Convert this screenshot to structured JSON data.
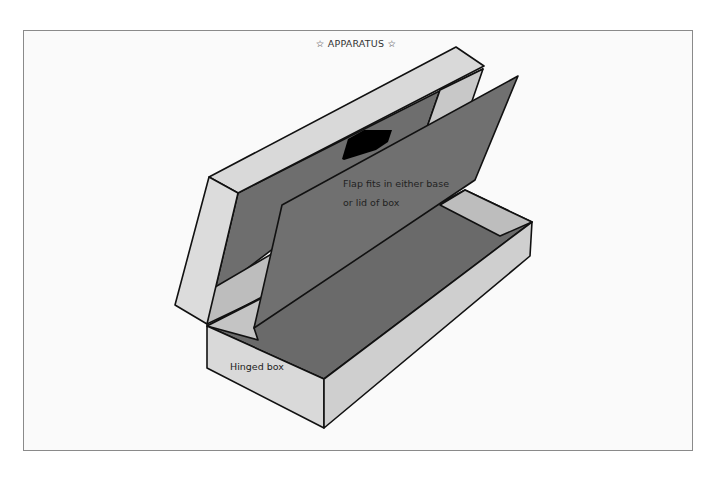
{
  "title": "☆ APPARATUS ☆",
  "labels": {
    "flap_line1": "Flap fits in either base",
    "flap_line2": "or lid of box",
    "box": "Hinged box"
  },
  "colors": {
    "light_face": "#d9d9d9",
    "mid_face": "#bdbdbd",
    "dark_face": "#6e6e6e",
    "flap": "#707070",
    "arrow": "#000000",
    "outline": "#111111",
    "frame_border": "#8a8a8a"
  }
}
